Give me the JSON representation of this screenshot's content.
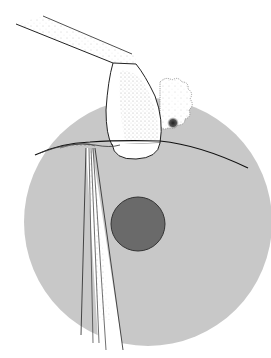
{
  "figure": {
    "colors": {
      "background": "#ffffff",
      "sphere": "#c8c8c8",
      "nucleus": "#6a6a6a",
      "nucleus_stroke": "#333333",
      "line": "#222222",
      "stipple": "#555555"
    },
    "elements": [
      {
        "name": "large-sphere",
        "label": "Large gray sphere"
      },
      {
        "name": "nucleus",
        "label": "Dark inner nucleus"
      },
      {
        "name": "holding-pipette",
        "label": "Angled pipette with bulb"
      },
      {
        "name": "cell-cluster",
        "label": "Textured cell cluster with dark spot"
      },
      {
        "name": "needle",
        "label": "Thin needle penetrating sphere"
      }
    ]
  }
}
